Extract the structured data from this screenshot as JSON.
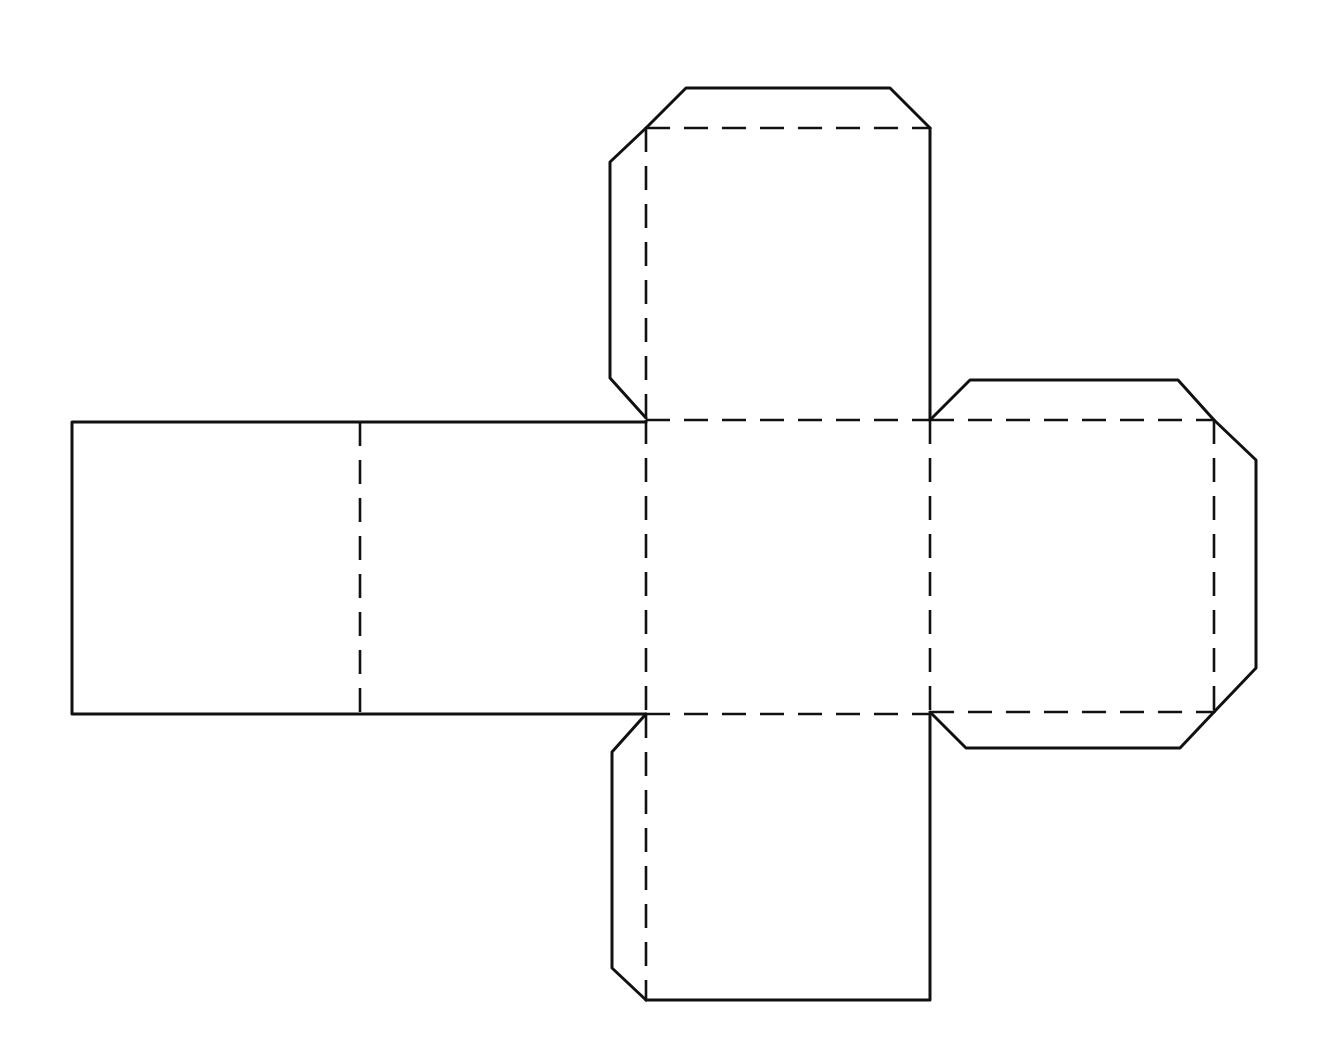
{
  "diagram": {
    "type": "cube-net",
    "line_color": "#111111",
    "background": "#ffffff",
    "legend": {
      "cut_line": "solid",
      "fold_line": "dashed"
    },
    "faces": [
      {
        "id": "face-left-end",
        "x": 72,
        "y": 422,
        "w": 288,
        "h": 292
      },
      {
        "id": "face-left-middle",
        "x": 360,
        "y": 422,
        "w": 286,
        "h": 292
      },
      {
        "id": "face-center",
        "x": 646,
        "y": 420,
        "w": 284,
        "h": 294
      },
      {
        "id": "face-top",
        "x": 646,
        "y": 128,
        "w": 284,
        "h": 292
      },
      {
        "id": "face-right",
        "x": 930,
        "y": 420,
        "w": 284,
        "h": 294
      },
      {
        "id": "face-bottom",
        "x": 646,
        "y": 714,
        "w": 284,
        "h": 286
      }
    ],
    "tabs": [
      {
        "id": "tab-top-of-top-face",
        "points": "646,128 686,88 890,88 930,128"
      },
      {
        "id": "tab-left-of-top-face",
        "points": "646,128 610,162 610,378 646,418"
      },
      {
        "id": "tab-top-of-right-face",
        "points": "930,420 970,380 1178,380 1214,420"
      },
      {
        "id": "tab-right-of-right-face",
        "points": "1214,420 1256,460 1256,668 1214,712"
      },
      {
        "id": "tab-bottom-of-right-face",
        "points": "930,712 966,748 1180,748 1214,712"
      },
      {
        "id": "tab-left-of-bottom-face",
        "points": "646,714 612,752 612,968 646,1000"
      }
    ],
    "fold_lines": [
      {
        "id": "fold-1",
        "x1": 360,
        "y1": 422,
        "x2": 360,
        "y2": 714
      },
      {
        "id": "fold-2",
        "x1": 646,
        "y1": 420,
        "x2": 646,
        "y2": 714
      },
      {
        "id": "fold-3",
        "x1": 646,
        "y1": 420,
        "x2": 930,
        "y2": 420
      },
      {
        "id": "fold-4",
        "x1": 646,
        "y1": 714,
        "x2": 930,
        "y2": 714
      },
      {
        "id": "fold-5",
        "x1": 930,
        "y1": 420,
        "x2": 930,
        "y2": 714
      },
      {
        "id": "fold-6",
        "x1": 646,
        "y1": 128,
        "x2": 930,
        "y2": 128
      },
      {
        "id": "fold-7",
        "x1": 646,
        "y1": 128,
        "x2": 646,
        "y2": 420
      },
      {
        "id": "fold-8",
        "x1": 930,
        "y1": 420,
        "x2": 1214,
        "y2": 420
      },
      {
        "id": "fold-9",
        "x1": 1214,
        "y1": 420,
        "x2": 1214,
        "y2": 712
      },
      {
        "id": "fold-10",
        "x1": 930,
        "y1": 712,
        "x2": 1214,
        "y2": 712
      },
      {
        "id": "fold-11",
        "x1": 646,
        "y1": 714,
        "x2": 646,
        "y2": 1000
      }
    ],
    "cut_lines": [
      {
        "id": "cut-left-top",
        "points": "646,422 72,422 72,714 646,714"
      },
      {
        "id": "cut-top-face-right",
        "points": "930,128 930,420"
      },
      {
        "id": "cut-bottom-face",
        "points": "646,1000 930,1000 930,714"
      }
    ]
  }
}
